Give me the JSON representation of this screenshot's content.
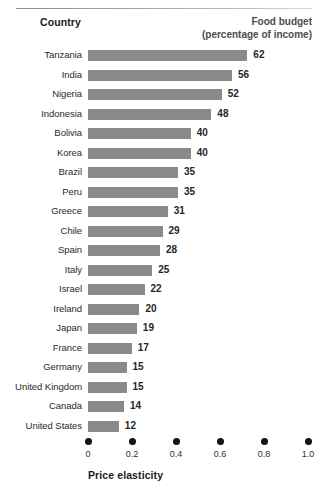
{
  "headers": {
    "country": "Country",
    "food_budget_line1": "Food budget",
    "food_budget_line2": "(percentage of income)"
  },
  "axis": {
    "title": "Price elasticity",
    "ticks": [
      "0",
      "0.2",
      "0.4",
      "0.6",
      "0.8",
      "1.0"
    ]
  },
  "colors": {
    "bar": "#8a8a8a",
    "dot": "#131313",
    "text": "#1b1b1b"
  },
  "chart_data": {
    "type": "bar",
    "orientation": "horizontal",
    "title": "",
    "xlabel": "Price elasticity",
    "ylabel": "Country",
    "value_axis_label": "Food budget (percentage of income)",
    "grid": false,
    "legend": null,
    "xlim": [
      0,
      1.0
    ],
    "xticks": [
      0,
      0.2,
      0.4,
      0.6,
      0.8,
      1.0
    ],
    "value_range": [
      0,
      62
    ],
    "categories": [
      "Tanzania",
      "India",
      "Nigeria",
      "Indonesia",
      "Bolivia",
      "Korea",
      "Brazil",
      "Peru",
      "Greece",
      "Chile",
      "Spain",
      "Italy",
      "Israel",
      "Ireland",
      "Japan",
      "France",
      "Germany",
      "United Kingdom",
      "Canada",
      "United States"
    ],
    "values": [
      62,
      56,
      52,
      48,
      40,
      40,
      35,
      35,
      31,
      29,
      28,
      25,
      22,
      20,
      19,
      17,
      15,
      15,
      14,
      12
    ],
    "rows": [
      {
        "country": "Tanzania",
        "value": 62
      },
      {
        "country": "India",
        "value": 56
      },
      {
        "country": "Nigeria",
        "value": 52
      },
      {
        "country": "Indonesia",
        "value": 48
      },
      {
        "country": "Bolivia",
        "value": 40
      },
      {
        "country": "Korea",
        "value": 40
      },
      {
        "country": "Brazil",
        "value": 35
      },
      {
        "country": "Peru",
        "value": 35
      },
      {
        "country": "Greece",
        "value": 31
      },
      {
        "country": "Chile",
        "value": 29
      },
      {
        "country": "Spain",
        "value": 28
      },
      {
        "country": "Italy",
        "value": 25
      },
      {
        "country": "Israel",
        "value": 22
      },
      {
        "country": "Ireland",
        "value": 20
      },
      {
        "country": "Japan",
        "value": 19
      },
      {
        "country": "France",
        "value": 17
      },
      {
        "country": "Germany",
        "value": 15
      },
      {
        "country": "United Kingdom",
        "value": 15
      },
      {
        "country": "Canada",
        "value": 14
      },
      {
        "country": "United States",
        "value": 12
      }
    ]
  }
}
